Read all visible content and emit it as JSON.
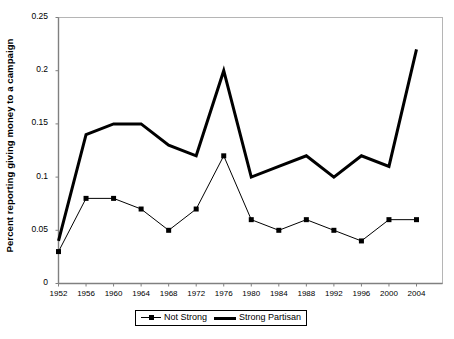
{
  "chart_data": {
    "type": "line",
    "title": "",
    "xlabel": "",
    "ylabel": "Percent reporting giving money to a campaign",
    "x": [
      1952,
      1956,
      1960,
      1964,
      1968,
      1972,
      1976,
      1980,
      1984,
      1988,
      1992,
      1996,
      2000,
      2004
    ],
    "xtick_labels": [
      "1952",
      "1956",
      "1960",
      "1964",
      "1968",
      "1972",
      "1976",
      "1980",
      "1984",
      "1988",
      "1992",
      "1996",
      "2000",
      "2004"
    ],
    "ytick_labels": [
      "0",
      "0.05",
      "0.1",
      "0.15",
      "0.2",
      "0.25"
    ],
    "ytick_values": [
      0,
      0.05,
      0.1,
      0.15,
      0.2,
      0.25
    ],
    "ylim": [
      0,
      0.25
    ],
    "xlim": [
      1952,
      2004
    ],
    "grid": false,
    "legend_position": "bottom",
    "series": [
      {
        "name": "Not Strong",
        "marker": "square",
        "line_width": 1,
        "color": "#000000",
        "values": [
          0.03,
          0.08,
          0.08,
          0.07,
          0.05,
          0.07,
          0.12,
          0.06,
          0.05,
          0.06,
          0.05,
          0.04,
          0.06,
          0.06
        ]
      },
      {
        "name": "Strong Partisan",
        "marker": "none",
        "line_width": 3,
        "color": "#000000",
        "values": [
          0.04,
          0.14,
          0.15,
          0.15,
          0.13,
          0.12,
          0.2,
          0.1,
          0.11,
          0.12,
          0.1,
          0.12,
          0.11,
          0.22
        ]
      }
    ]
  },
  "legend": {
    "entries": [
      {
        "label": "Not Strong"
      },
      {
        "label": "Strong Partisan"
      }
    ]
  },
  "colors": {
    "series_color": "#000000",
    "frame_color": "#b5b5b5",
    "axis_color": "#808080",
    "background": "#ffffff"
  }
}
